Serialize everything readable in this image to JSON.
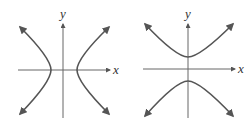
{
  "figures": [
    {
      "name": "horizontal-hyperbola",
      "x_label": "x",
      "y_label": "y",
      "orientation": "horizontal transverse axis"
    },
    {
      "name": "vertical-hyperbola",
      "x_label": "x",
      "y_label": "y",
      "orientation": "vertical transverse axis"
    }
  ],
  "colors": {
    "curve": "#555555",
    "axis": "#666666"
  }
}
